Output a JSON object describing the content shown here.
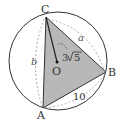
{
  "diagram": {
    "points": {
      "A": {
        "label": "A",
        "x": 43,
        "y": 108
      },
      "B": {
        "label": "B",
        "x": 106,
        "y": 72
      },
      "C": {
        "label": "C",
        "x": 46,
        "y": 17
      },
      "O": {
        "label": "O",
        "x": 57,
        "y": 62
      }
    },
    "circle": {
      "cx": 58,
      "cy": 61,
      "r": 49
    },
    "labels": {
      "a": "a",
      "b": "b",
      "side_AB": "10",
      "radius": "3√5",
      "radius_coef": "3",
      "radius_root": "5"
    },
    "colors": {
      "fill": "#b8b8b8",
      "stroke": "#333333",
      "dashed": "#999999"
    }
  }
}
